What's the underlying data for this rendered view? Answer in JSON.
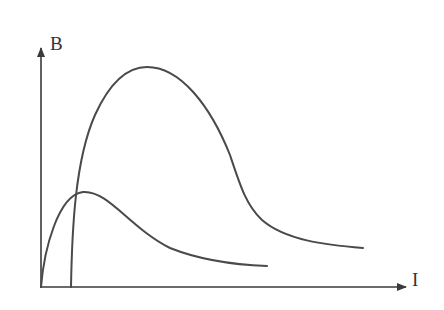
{
  "diagram": {
    "y_axis": {
      "label": "B"
    },
    "x_axis": {
      "label": "I"
    },
    "curves": [
      {
        "id": "large-curve",
        "description": "tall curve starting at offset on I axis, rising to high peak, then decaying"
      },
      {
        "id": "small-curve",
        "description": "low curve starting at origin, small early peak, then decaying"
      }
    ]
  },
  "colors": {
    "stroke": "#4a4a4a",
    "background": "#ffffff"
  }
}
